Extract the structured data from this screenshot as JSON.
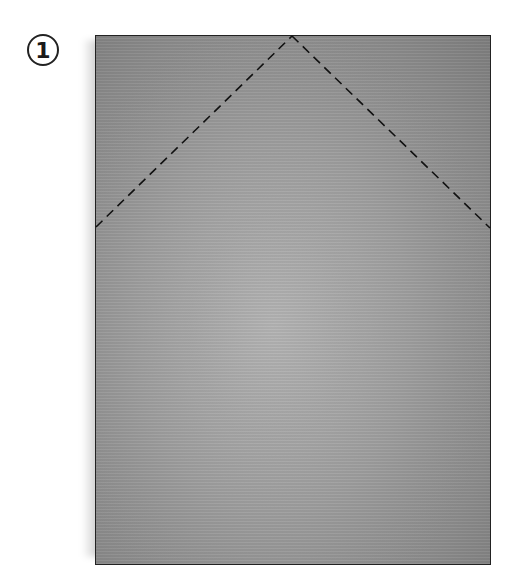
{
  "step": {
    "number": "1"
  },
  "diagram": {
    "paper_color": "#9e9e9e",
    "border_color": "#222222",
    "fold_lines": [
      {
        "type": "dashed",
        "from": [
          95,
          227
        ],
        "to": [
          292,
          35
        ]
      },
      {
        "type": "dashed",
        "from": [
          292,
          35
        ],
        "to": [
          490,
          228
        ]
      }
    ]
  }
}
